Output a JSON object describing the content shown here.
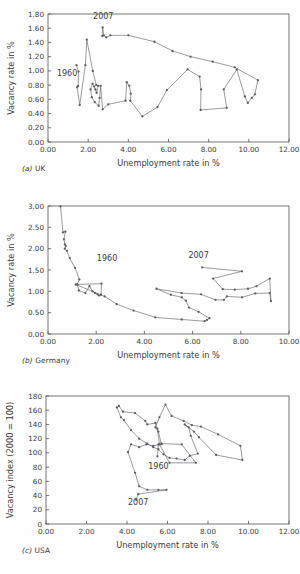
{
  "figure": {
    "background": "#fefefe",
    "line_color": "#5c5c66",
    "axis_color": "#555555",
    "text_color": "#3b3b3b"
  },
  "panels": [
    {
      "caption_letter": "(a)",
      "caption_text": "UK",
      "chart_data": {
        "type": "line",
        "title": "",
        "xlabel": "Unemployment rate in %",
        "ylabel": "Vacancy rate in %",
        "xlim": [
          0,
          12
        ],
        "ylim": [
          0,
          1.8
        ],
        "xticks": [
          "0.00",
          "2.00",
          "4.00",
          "6.00",
          "8.00",
          "10.00",
          "12.00"
        ],
        "xtick_values": [
          0,
          2,
          4,
          6,
          8,
          10,
          12
        ],
        "yticks": [
          "0.00",
          "0.20",
          "0.40",
          "0.60",
          "0.80",
          "1.00",
          "1.20",
          "1.40",
          "1.60",
          "1.80"
        ],
        "ytick_values": [
          0,
          0.2,
          0.4,
          0.6,
          0.8,
          1.0,
          1.2,
          1.4,
          1.6,
          1.8
        ],
        "grid": false,
        "legend": "none",
        "annotations": [
          {
            "label": "1960",
            "x": 0.95,
            "y": 0.93
          },
          {
            "label": "2007",
            "x": 2.75,
            "y": 1.73
          }
        ],
        "series": [
          {
            "name": "UK Beveridge curve 1960-2007",
            "points": [
              [
                1.42,
                1.08
              ],
              [
                1.52,
                0.99
              ],
              [
                1.5,
                0.79
              ],
              [
                1.45,
                0.77
              ],
              [
                1.58,
                0.52
              ],
              [
                1.86,
                1.08
              ],
              [
                1.93,
                1.44
              ],
              [
                2.23,
                1.0
              ],
              [
                2.4,
                0.8
              ],
              [
                2.5,
                0.79
              ],
              [
                2.42,
                0.69
              ],
              [
                2.36,
                0.74
              ],
              [
                2.3,
                0.78
              ],
              [
                2.22,
                0.82
              ],
              [
                2.12,
                0.74
              ],
              [
                2.18,
                0.63
              ],
              [
                2.33,
                0.56
              ],
              [
                2.52,
                0.51
              ],
              [
                2.57,
                0.62
              ],
              [
                2.62,
                0.79
              ],
              [
                2.72,
                0.46
              ],
              [
                3.0,
                0.53
              ],
              [
                3.86,
                0.58
              ],
              [
                3.92,
                0.84
              ],
              [
                4.05,
                0.79
              ],
              [
                4.12,
                0.68
              ],
              [
                4.1,
                0.58
              ],
              [
                4.7,
                0.36
              ],
              [
                5.45,
                0.49
              ],
              [
                5.92,
                0.73
              ],
              [
                6.95,
                1.02
              ],
              [
                7.55,
                0.92
              ],
              [
                7.62,
                0.74
              ],
              [
                7.6,
                0.45
              ],
              [
                8.9,
                0.48
              ],
              [
                8.75,
                0.74
              ],
              [
                9.4,
                1.02
              ],
              [
                9.8,
                0.64
              ],
              [
                9.95,
                0.55
              ],
              [
                10.15,
                0.62
              ],
              [
                10.3,
                0.67
              ],
              [
                10.45,
                0.87
              ],
              [
                9.3,
                1.05
              ],
              [
                8.2,
                1.13
              ],
              [
                7.1,
                1.2
              ],
              [
                6.2,
                1.28
              ],
              [
                5.3,
                1.41
              ],
              [
                4.0,
                1.5
              ],
              [
                3.1,
                1.5
              ],
              [
                2.9,
                1.47
              ],
              [
                2.78,
                1.5
              ],
              [
                2.72,
                1.61
              ],
              [
                2.7,
                1.49
              ]
            ]
          }
        ]
      }
    },
    {
      "caption_letter": "(b)",
      "caption_text": "Germany",
      "chart_data": {
        "type": "line",
        "title": "",
        "xlabel": "Unemployment rate in %",
        "ylabel": "Vacancy rate in %",
        "xlim": [
          0,
          10
        ],
        "ylim": [
          0,
          3.0
        ],
        "xticks": [
          "0.00",
          "2.00",
          "4.00",
          "6.00",
          "8.00",
          "10.00"
        ],
        "xtick_values": [
          0,
          2,
          4,
          6,
          8,
          10
        ],
        "yticks": [
          "0.00",
          "0.50",
          "1.00",
          "1.50",
          "2.00",
          "2.50",
          "3.00"
        ],
        "ytick_values": [
          0,
          0.5,
          1.0,
          1.5,
          2.0,
          2.5,
          3.0
        ],
        "grid": false,
        "legend": "none",
        "annotations": [
          {
            "label": "1960",
            "x": 2.45,
            "y": 1.72
          },
          {
            "label": "2007",
            "x": 6.25,
            "y": 1.78
          }
        ],
        "series": [
          {
            "name": "Germany Beveridge curve 1960-2007",
            "points": [
              [
                0.52,
                2.99
              ],
              [
                0.62,
                2.38
              ],
              [
                0.72,
                2.4
              ],
              [
                0.66,
                2.22
              ],
              [
                0.7,
                2.1
              ],
              [
                0.74,
                2.06
              ],
              [
                0.7,
                2.0
              ],
              [
                0.78,
                1.95
              ],
              [
                0.9,
                1.78
              ],
              [
                1.12,
                1.55
              ],
              [
                1.3,
                1.28
              ],
              [
                1.22,
                1.16
              ],
              [
                1.28,
                1.02
              ],
              [
                1.55,
                0.96
              ],
              [
                1.72,
                1.12
              ],
              [
                1.85,
                1.0
              ],
              [
                1.95,
                0.96
              ],
              [
                2.05,
                0.93
              ],
              [
                2.12,
                0.9
              ],
              [
                2.2,
                0.92
              ],
              [
                2.22,
                1.18
              ],
              [
                1.15,
                1.16
              ],
              [
                2.35,
                0.88
              ],
              [
                2.85,
                0.7
              ],
              [
                3.55,
                0.55
              ],
              [
                4.45,
                0.39
              ],
              [
                5.55,
                0.34
              ],
              [
                6.5,
                0.3
              ],
              [
                6.6,
                0.33
              ],
              [
                6.7,
                0.37
              ],
              [
                6.25,
                0.52
              ],
              [
                5.85,
                0.62
              ],
              [
                5.72,
                0.78
              ],
              [
                5.55,
                0.86
              ],
              [
                5.1,
                0.92
              ],
              [
                4.5,
                1.06
              ],
              [
                5.55,
                0.96
              ],
              [
                6.35,
                0.93
              ],
              [
                6.95,
                0.8
              ],
              [
                7.3,
                0.8
              ],
              [
                7.42,
                0.88
              ],
              [
                8.05,
                0.86
              ],
              [
                8.6,
                0.95
              ],
              [
                9.2,
                0.96
              ],
              [
                9.25,
                0.77
              ],
              [
                9.2,
                1.3
              ],
              [
                8.65,
                1.12
              ],
              [
                8.3,
                1.06
              ],
              [
                7.75,
                1.04
              ],
              [
                7.25,
                1.05
              ],
              [
                6.85,
                1.3
              ],
              [
                8.05,
                1.47
              ],
              [
                6.4,
                1.56
              ]
            ]
          }
        ]
      }
    },
    {
      "caption_letter": "(c)",
      "caption_text": "USA",
      "chart_data": {
        "type": "line",
        "title": "",
        "xlabel": "Unemployment rate in %",
        "ylabel": "Vacancy index (2000 = 100)",
        "xlim": [
          0,
          12
        ],
        "ylim": [
          0,
          180
        ],
        "xticks": [
          "0.00",
          "2.00",
          "4.00",
          "6.00",
          "8.00",
          "10.00",
          "12.00"
        ],
        "xtick_values": [
          0,
          2,
          4,
          6,
          8,
          10,
          12
        ],
        "yticks": [
          "0",
          "20",
          "40",
          "60",
          "80",
          "100",
          "120",
          "140",
          "160",
          "180"
        ],
        "ytick_values": [
          0,
          20,
          40,
          60,
          80,
          100,
          120,
          140,
          160,
          180
        ],
        "grid": false,
        "legend": "none",
        "annotations": [
          {
            "label": "1960",
            "x": 5.55,
            "y": 77
          },
          {
            "label": "2007",
            "x": 4.55,
            "y": 27
          }
        ],
        "series": [
          {
            "name": "USA Beveridge curve 1960-2007",
            "points": [
              [
                5.5,
                95
              ],
              [
                5.55,
                112
              ],
              [
                5.7,
                113
              ],
              [
                6.7,
                112
              ],
              [
                7.4,
                86
              ],
              [
                6.1,
                86
              ],
              [
                5.6,
                112
              ],
              [
                5.5,
                134
              ],
              [
                5.4,
                142
              ],
              [
                5.0,
                140
              ],
              [
                4.9,
                145
              ],
              [
                4.4,
                156
              ],
              [
                3.8,
                158
              ],
              [
                3.6,
                166
              ],
              [
                3.5,
                164
              ],
              [
                3.7,
                150
              ],
              [
                3.85,
                146
              ],
              [
                4.2,
                132
              ],
              [
                4.6,
                120
              ],
              [
                5.0,
                113
              ],
              [
                5.3,
                108
              ],
              [
                5.55,
                105
              ],
              [
                5.8,
                98
              ],
              [
                6.1,
                93
              ],
              [
                6.45,
                92
              ],
              [
                6.85,
                90
              ],
              [
                7.1,
                96
              ],
              [
                7.5,
                99
              ],
              [
                7.15,
                124
              ],
              [
                7.05,
                136
              ],
              [
                6.85,
                140
              ],
              [
                7.3,
                130
              ],
              [
                7.55,
                122
              ],
              [
                8.4,
                97
              ],
              [
                9.7,
                90
              ],
              [
                9.6,
                110
              ],
              [
                8.5,
                126
              ],
              [
                7.65,
                137
              ],
              [
                7.2,
                139
              ],
              [
                6.8,
                145
              ],
              [
                6.2,
                152
              ],
              [
                5.9,
                168
              ],
              [
                5.6,
                150
              ],
              [
                5.4,
                136
              ],
              [
                5.55,
                130
              ],
              [
                5.7,
                112
              ],
              [
                5.3,
                110
              ],
              [
                4.95,
                112
              ],
              [
                4.6,
                108
              ],
              [
                4.2,
                112
              ],
              [
                4.05,
                101
              ],
              [
                4.4,
                72
              ],
              [
                4.6,
                53
              ],
              [
                5.0,
                48
              ],
              [
                5.55,
                48
              ],
              [
                5.95,
                48
              ],
              [
                4.55,
                42
              ],
              [
                4.45,
                34
              ]
            ]
          }
        ]
      }
    }
  ]
}
